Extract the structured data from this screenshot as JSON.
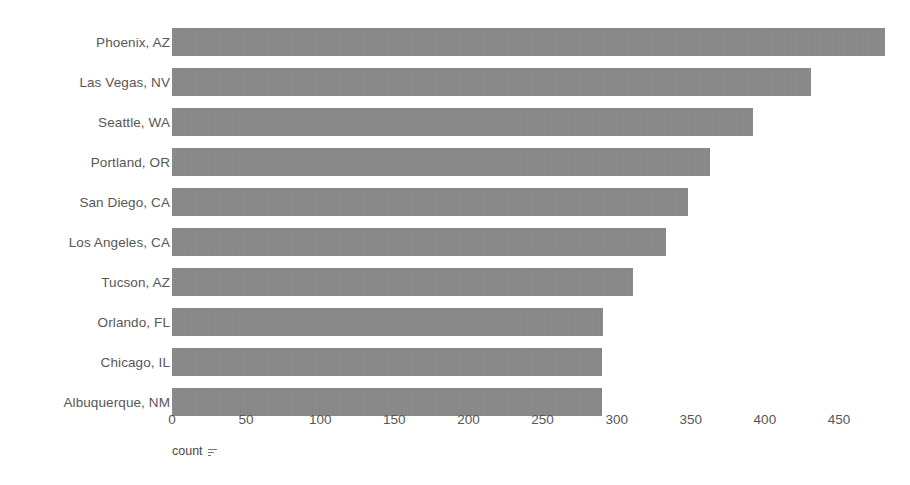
{
  "chart_data": {
    "type": "bar",
    "orientation": "horizontal",
    "title": "",
    "xlabel": "count",
    "ylabel": "",
    "xlim": [
      0,
      480
    ],
    "xticks": [
      0,
      50,
      100,
      150,
      200,
      250,
      300,
      350,
      400,
      450
    ],
    "grid": false,
    "legend": null,
    "bar_color": "#8a8a8a",
    "categories": [
      "Phoenix, AZ",
      "Las Vegas, NV",
      "Seattle, WA",
      "Portland, OR",
      "San Diego, CA",
      "Los Angeles, CA",
      "Tucson, AZ",
      "Orlando, FL",
      "Chicago, IL",
      "Albuquerque, NM"
    ],
    "values": [
      481,
      431,
      392,
      363,
      348,
      333,
      311,
      291,
      290,
      290
    ]
  },
  "axis": {
    "title_text": "count",
    "sort_indicator": "sort-descending-icon"
  }
}
